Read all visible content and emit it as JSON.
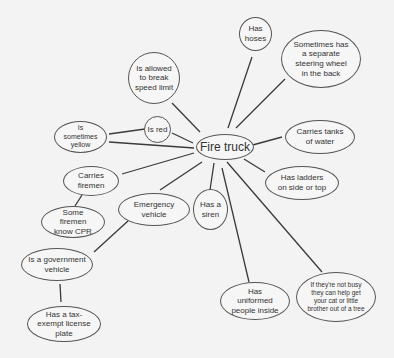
{
  "diagram": {
    "type": "concept-map",
    "center": {
      "id": "fire-truck",
      "label": "Fire truck"
    },
    "nodes": [
      {
        "id": "has-hoses",
        "label": "Has hoses"
      },
      {
        "id": "separate-steering",
        "label": "Sometimes has a separate steering wheel in the back"
      },
      {
        "id": "tanks-water",
        "label": "Carries tanks of water"
      },
      {
        "id": "ladders",
        "label": "Has ladders on side or top"
      },
      {
        "id": "help-cat",
        "label": "If they're not busy they can help get your cat or little brother out of a tree"
      },
      {
        "id": "uniformed",
        "label": "Has uniformed people inside"
      },
      {
        "id": "siren",
        "label": "Has a siren"
      },
      {
        "id": "emergency",
        "label": "Emergency vehicle"
      },
      {
        "id": "carries-firemen",
        "label": "Carries firemen"
      },
      {
        "id": "sometimes-yellow",
        "label": "Is sometimes yellow"
      },
      {
        "id": "is-red",
        "label": "Is red"
      },
      {
        "id": "speed-limit",
        "label": "Is allowed to break speed limit"
      },
      {
        "id": "cpr",
        "label": "Some firemen know CPR"
      },
      {
        "id": "government",
        "label": "Is a government vehicle"
      },
      {
        "id": "tax-exempt",
        "label": "Has a tax-exempt license plate"
      }
    ],
    "edges": [
      [
        "fire-truck",
        "has-hoses"
      ],
      [
        "fire-truck",
        "separate-steering"
      ],
      [
        "fire-truck",
        "tanks-water"
      ],
      [
        "fire-truck",
        "ladders"
      ],
      [
        "fire-truck",
        "help-cat"
      ],
      [
        "fire-truck",
        "uniformed"
      ],
      [
        "fire-truck",
        "siren"
      ],
      [
        "fire-truck",
        "emergency"
      ],
      [
        "fire-truck",
        "carries-firemen"
      ],
      [
        "fire-truck",
        "sometimes-yellow"
      ],
      [
        "fire-truck",
        "is-red"
      ],
      [
        "fire-truck",
        "speed-limit"
      ],
      [
        "is-red",
        "sometimes-yellow"
      ],
      [
        "carries-firemen",
        "cpr"
      ],
      [
        "emergency",
        "government"
      ],
      [
        "government",
        "tax-exempt"
      ]
    ]
  },
  "labels": {
    "fire_truck": "Fire truck",
    "has_hoses": "Has hoses",
    "separate_steering": "Sometimes has a separate steering wheel in the back",
    "tanks_water": "Carries tanks of water",
    "ladders": "Has ladders on side or top",
    "help_cat": "If they're not busy they can help get your cat or little brother out of a tree",
    "uniformed": "Has uniformed people inside",
    "siren": "Has a siren",
    "emergency": "Emergency vehicle",
    "carries_firemen": "Carries firemen",
    "sometimes_yellow": "Is sometimes yellow",
    "is_red": "Is red",
    "speed_limit": "Is allowed to break speed limit",
    "cpr": "Some firemen know CPR",
    "government": "Is a government vehicle",
    "tax_exempt": "Has a tax-exempt license plate"
  },
  "colors": {
    "background": "#f3f3f3",
    "stroke": "#555555",
    "text": "#333333"
  }
}
